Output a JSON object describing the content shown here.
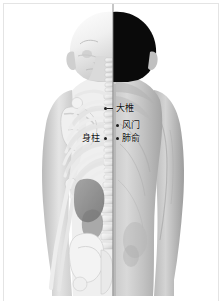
{
  "figure": {
    "orientation": "posterior",
    "split_axis_x_px": 113,
    "rendering": "grayscale"
  },
  "colors": {
    "background": "#ffffff",
    "border": "#e4e4e4",
    "hair_black": "#0a0a0a",
    "skin_light": "#d8d8d8",
    "skin_mid": "#bdbdbd",
    "skin_shadow": "#9a9a9a",
    "bone_light": "#f2f2f2",
    "bone_mid": "#dcdcdc",
    "bone_shadow": "#b0b0b0",
    "organ_dark": "#6e6e6e",
    "label_text": "#101010",
    "marker_dot": "#1d1d1d"
  },
  "annotations": [
    {
      "id": "dazhui",
      "label": "大椎",
      "pinyin": "Dazhui",
      "code": "GV14",
      "side": "right",
      "has_leader_line": true,
      "x": 104,
      "y": 104
    },
    {
      "id": "fengmen",
      "label": "风门",
      "pinyin": "Fengmen",
      "code": "BL12",
      "side": "right",
      "has_leader_line": false,
      "x": 116,
      "y": 121
    },
    {
      "id": "feishu",
      "label": "肺俞",
      "pinyin": "Feishu",
      "code": "BL13",
      "side": "right",
      "has_leader_line": false,
      "x": 116,
      "y": 134
    },
    {
      "id": "shenzhu",
      "label": "身柱",
      "pinyin": "Shenzhu",
      "code": "GV12",
      "side": "left",
      "has_leader_line": false,
      "x": 82,
      "y": 134
    }
  ],
  "anatomy_left": {
    "visible_structures": [
      "颅骨",
      "颈椎",
      "肩胛骨",
      "锁骨",
      "肋骨",
      "脈椎",
      "肱骨",
      "尺骨",
      "桩骨",
      "骶骨"
    ]
  },
  "anatomy_right": {
    "visible_structures": [
      "头发",
      "颈部",
      "肩部",
      "背背",
      "腰部",
      "上臂"
    ]
  }
}
